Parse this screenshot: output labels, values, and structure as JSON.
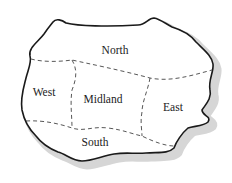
{
  "map": {
    "regions": [
      {
        "name": "North",
        "x": 115,
        "y": 50
      },
      {
        "name": "West",
        "x": 44,
        "y": 92
      },
      {
        "name": "Midland",
        "x": 103,
        "y": 99
      },
      {
        "name": "East",
        "x": 173,
        "y": 107
      },
      {
        "name": "South",
        "x": 95,
        "y": 142
      }
    ],
    "colors": {
      "outline": "#1a1a1a",
      "shadow": "#d4d4d4",
      "fill": "#ffffff",
      "border": "#444444"
    }
  }
}
